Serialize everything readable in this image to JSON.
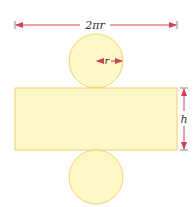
{
  "diagram": {
    "labels": {
      "circumference": "2πr",
      "radius": "r",
      "height": "h"
    },
    "colors": {
      "fill": "#fdf8c8",
      "stroke": "#f0d070",
      "arrow": "#d0405a",
      "text": "#333333"
    },
    "shapes": {
      "top_circle": {
        "cx": 96,
        "cy": 61,
        "r": 27
      },
      "rectangle": {
        "x": 15,
        "y": 88,
        "width": 162,
        "height": 62
      },
      "bottom_circle": {
        "cx": 96,
        "cy": 177,
        "r": 27
      }
    }
  }
}
